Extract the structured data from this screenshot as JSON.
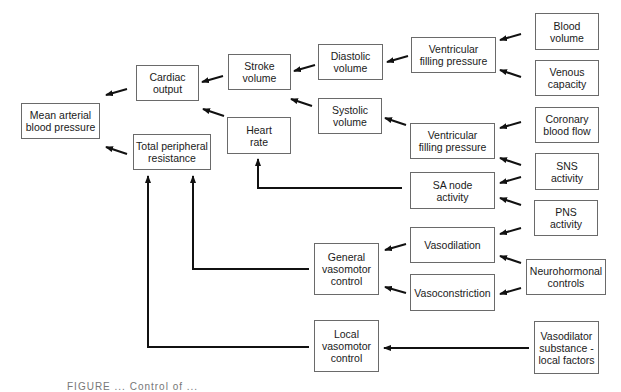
{
  "diagram": {
    "type": "flowchart",
    "nodes": {
      "map": "Mean arterial\nblood pressure",
      "cardiac_output": "Cardiac\noutput",
      "tpr": "Total peripheral\nresistance",
      "stroke_volume": "Stroke\nvolume",
      "heart_rate": "Heart\nrate",
      "diastolic_volume": "Diastolic\nvolume",
      "systolic_volume": "Systolic\nvolume",
      "vfp_top": "Ventricular\nfilling pressure",
      "vfp_bottom": "Ventricular\nfilling pressure",
      "sa_node": "SA node\nactivity",
      "vasodilation": "Vasodilation",
      "vasoconstriction": "Vasoconstriction",
      "general_vasomotor": "General\nvasomotor\ncontrol",
      "local_vasomotor": "Local\nvasomotor\ncontrol",
      "blood_volume": "Blood\nvolume",
      "venous_capacity": "Venous\ncapacity",
      "coronary_blood_flow": "Coronary\nblood flow",
      "sns_activity": "SNS\nactivity",
      "pns_activity": "PNS\nactivity",
      "neurohormonal": "Neurohormonal\ncontrols",
      "vasodilator_substance": "Vasodilator\nsubstance -\nlocal factors"
    },
    "edges": [
      {
        "from": "cardiac_output",
        "to": "map"
      },
      {
        "from": "tpr",
        "to": "map"
      },
      {
        "from": "stroke_volume",
        "to": "cardiac_output"
      },
      {
        "from": "heart_rate",
        "to": "cardiac_output"
      },
      {
        "from": "diastolic_volume",
        "to": "stroke_volume"
      },
      {
        "from": "systolic_volume",
        "to": "stroke_volume"
      },
      {
        "from": "vfp_top",
        "to": "diastolic_volume"
      },
      {
        "from": "vfp_bottom",
        "to": "systolic_volume"
      },
      {
        "from": "blood_volume",
        "to": "vfp_top"
      },
      {
        "from": "venous_capacity",
        "to": "vfp_top"
      },
      {
        "from": "coronary_blood_flow",
        "to": "vfp_bottom"
      },
      {
        "from": "sns_activity",
        "to": "vfp_bottom"
      },
      {
        "from": "sns_activity",
        "to": "sa_node"
      },
      {
        "from": "pns_activity",
        "to": "sa_node"
      },
      {
        "from": "sa_node",
        "to": "heart_rate"
      },
      {
        "from": "pns_activity",
        "to": "vasodilation"
      },
      {
        "from": "neurohormonal",
        "to": "vasodilation"
      },
      {
        "from": "neurohormonal",
        "to": "vasoconstriction"
      },
      {
        "from": "vasodilation",
        "to": "general_vasomotor"
      },
      {
        "from": "vasoconstriction",
        "to": "general_vasomotor"
      },
      {
        "from": "general_vasomotor",
        "to": "tpr"
      },
      {
        "from": "local_vasomotor",
        "to": "tpr"
      },
      {
        "from": "vasodilator_substance",
        "to": "local_vasomotor"
      }
    ],
    "caption": "FIGURE ... Control of ..."
  }
}
